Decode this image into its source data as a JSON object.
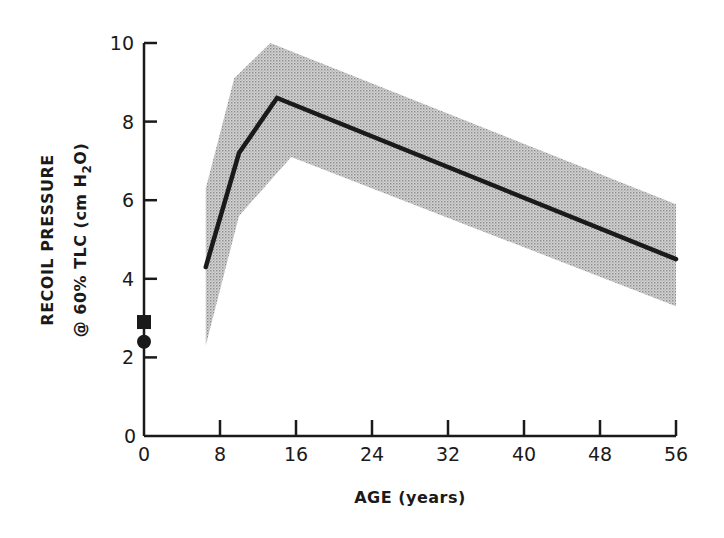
{
  "chart_data": {
    "type": "line",
    "title": "",
    "xlabel": "AGE (years)",
    "ylabel_line1": "RECOIL PRESSURE",
    "ylabel_line2_pre": "@ 60% TLC (cm H",
    "ylabel_line2_sub": "2",
    "ylabel_line2_post": "O)",
    "xlim": [
      0,
      56
    ],
    "ylim": [
      0,
      10
    ],
    "x_ticks": [
      0,
      8,
      16,
      24,
      32,
      40,
      48,
      56
    ],
    "y_ticks": [
      0,
      2,
      4,
      6,
      8,
      10
    ],
    "grid": false,
    "legend": null,
    "series": [
      {
        "name": "mean recoil pressure",
        "style": "solid black line",
        "x": [
          6.5,
          10,
          14,
          56
        ],
        "y": [
          4.3,
          7.2,
          8.6,
          4.5
        ]
      },
      {
        "name": "range band",
        "style": "grey stippled area",
        "upper": {
          "x": [
            6.5,
            9.5,
            13.3,
            56
          ],
          "y": [
            6.3,
            9.1,
            10.0,
            5.9
          ]
        },
        "lower": {
          "x": [
            6.5,
            10,
            15.5,
            56
          ],
          "y": [
            2.3,
            5.6,
            7.1,
            3.3
          ]
        }
      },
      {
        "name": "age 0 square marker",
        "marker": "square",
        "x": [
          0
        ],
        "y": [
          2.9
        ]
      },
      {
        "name": "age 0 circle marker",
        "marker": "circle",
        "x": [
          0
        ],
        "y": [
          2.4
        ]
      }
    ]
  },
  "colors": {
    "ink": "#1a1a1a",
    "band": "#bdbdbd",
    "background": "#ffffff"
  }
}
